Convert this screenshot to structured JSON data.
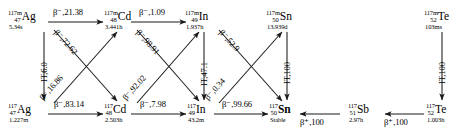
{
  "diagram": {
    "type": "nuclear-decay-chain",
    "stroke_color": "#1a1a1a",
    "background": "#ffffff"
  },
  "nuclides": [
    {
      "id": "ag117m",
      "mass": "117m",
      "z": "47",
      "symbol": "Ag",
      "halflife": "5.34s",
      "bold": false
    },
    {
      "id": "ag117",
      "mass": "117",
      "z": "47",
      "symbol": "Ag",
      "halflife": "1.227m",
      "bold": false
    },
    {
      "id": "cd117m",
      "mass": "117m",
      "z": "48",
      "symbol": "Cd",
      "halflife": "3.441h",
      "bold": false
    },
    {
      "id": "cd117",
      "mass": "117",
      "z": "48",
      "symbol": "Cd",
      "halflife": "2.503h",
      "bold": false
    },
    {
      "id": "in117m",
      "mass": "117m",
      "z": "49",
      "symbol": "In",
      "halflife": "1.937h",
      "bold": false
    },
    {
      "id": "in117",
      "mass": "117",
      "z": "49",
      "symbol": "In",
      "halflife": "43.2m",
      "bold": false
    },
    {
      "id": "sn117m",
      "mass": "117m",
      "z": "50",
      "symbol": "Sn",
      "halflife": "13.939d",
      "bold": false
    },
    {
      "id": "sn117",
      "mass": "117",
      "z": "50",
      "symbol": "Sn",
      "halflife": "Stable",
      "bold": true
    },
    {
      "id": "sb117",
      "mass": "117",
      "z": "51",
      "symbol": "Sb",
      "halflife": "2.97h",
      "bold": false
    },
    {
      "id": "te117m",
      "mass": "117m",
      "z": "52",
      "symbol": "Te",
      "halflife": "103ms",
      "bold": false
    },
    {
      "id": "te117",
      "mass": "117",
      "z": "52",
      "symbol": "Te",
      "halflife": "1.003h",
      "bold": false
    }
  ],
  "transitions": [
    {
      "id": "t1",
      "from": "ag117m",
      "to": "cd117m",
      "mode": "β⁻",
      "branch": "21.38",
      "label": "β⁻,21.38"
    },
    {
      "id": "t2",
      "from": "ag117m",
      "to": "ag117",
      "mode": "IT",
      "branch": "6.0",
      "label": "IT,6.0"
    },
    {
      "id": "t3",
      "from": "ag117m",
      "to": "cd117",
      "mode": "β⁻",
      "branch": "72.62",
      "label": "β⁻,72.62"
    },
    {
      "id": "t4",
      "from": "ag117",
      "to": "cd117m",
      "mode": "β⁻",
      "branch": "16.86",
      "label": "β⁻,16.86"
    },
    {
      "id": "t5",
      "from": "ag117",
      "to": "cd117",
      "mode": "β⁻",
      "branch": "83.14",
      "label": "β⁻,83.14"
    },
    {
      "id": "t6",
      "from": "cd117m",
      "to": "in117m",
      "mode": "β⁻",
      "branch": "1.09",
      "label": "β⁻,1.09"
    },
    {
      "id": "t7",
      "from": "cd117m",
      "to": "in117",
      "mode": "β⁻",
      "branch": "98.91",
      "label": "β⁻,98.91"
    },
    {
      "id": "t8",
      "from": "cd117",
      "to": "in117m",
      "mode": "β⁻",
      "branch": "92.02",
      "label": "β⁻,92.02"
    },
    {
      "id": "t9",
      "from": "cd117",
      "to": "in117",
      "mode": "β⁻",
      "branch": "7.98",
      "label": "β⁻,7.98"
    },
    {
      "id": "t10",
      "from": "in117m",
      "to": "in117",
      "mode": "IT",
      "branch": "47.1",
      "label": "IT,47.1"
    },
    {
      "id": "t11",
      "from": "in117m",
      "to": "sn117",
      "mode": "β⁻",
      "branch": "52.9",
      "label": "β⁻,52.9"
    },
    {
      "id": "t12",
      "from": "in117",
      "to": "sn117m",
      "mode": "β⁻",
      "branch": "0.34",
      "label": "β⁻,0.34"
    },
    {
      "id": "t13",
      "from": "in117",
      "to": "sn117",
      "mode": "β⁻",
      "branch": "99.66",
      "label": "β⁻,99.66"
    },
    {
      "id": "t14",
      "from": "sn117m",
      "to": "sn117",
      "mode": "IT",
      "branch": "100",
      "label": "IT,100"
    },
    {
      "id": "t15",
      "from": "sb117",
      "to": "sn117",
      "mode": "β⁺",
      "branch": "100",
      "label": "β⁺,100"
    },
    {
      "id": "t16",
      "from": "te117",
      "to": "sb117",
      "mode": "β⁺",
      "branch": "100",
      "label": "β⁺,100"
    },
    {
      "id": "t17",
      "from": "te117m",
      "to": "te117",
      "mode": "IT",
      "branch": "100",
      "label": "IT,100"
    }
  ]
}
